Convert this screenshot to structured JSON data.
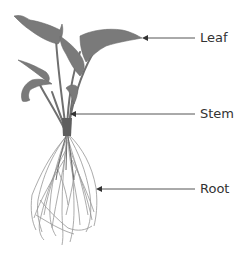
{
  "diagram": {
    "colors": {
      "background": "#ffffff",
      "plant": "#7a7a7a",
      "plant_dark": "#5e5e5e",
      "roots": "#8c8c8c",
      "arrow": "#555555",
      "text": "#333333"
    },
    "labels": [
      {
        "id": "leaf",
        "text": "Leaf",
        "x": 200,
        "y": 31,
        "arrow_from_x": 195,
        "arrow_to_x": 142,
        "arrow_y": 38
      },
      {
        "id": "stem",
        "text": "Stem",
        "x": 200,
        "y": 107,
        "arrow_from_x": 195,
        "arrow_to_x": 70,
        "arrow_y": 114
      },
      {
        "id": "root",
        "text": "Root",
        "x": 200,
        "y": 182,
        "arrow_from_x": 195,
        "arrow_to_x": 96,
        "arrow_y": 189
      }
    ]
  }
}
